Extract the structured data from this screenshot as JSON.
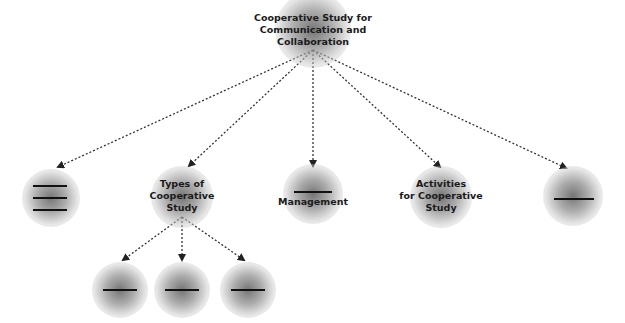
{
  "diagram": {
    "root": {
      "title_lines": [
        "Cooperative Study for",
        "Communication and",
        "Collaboration"
      ]
    },
    "children": [
      {
        "id": "blank-triple",
        "label": "",
        "blanks": 3
      },
      {
        "id": "types",
        "label_lines": [
          "Types of",
          "Cooperative",
          "Study"
        ],
        "children": [
          {
            "id": "type-1",
            "label": "",
            "blanks": 1
          },
          {
            "id": "type-2",
            "label": "",
            "blanks": 1
          },
          {
            "id": "type-3",
            "label": "",
            "blanks": 1
          }
        ]
      },
      {
        "id": "management",
        "label": "Management",
        "blanks": 1
      },
      {
        "id": "activities",
        "label_lines": [
          "Activities",
          "for Cooperative",
          "Study"
        ]
      },
      {
        "id": "blank-single",
        "label": "",
        "blanks": 1
      }
    ],
    "colors": {
      "node_shade": "#7a7a7a",
      "text": "#1a1a1a",
      "connector": "#333333",
      "background": "#ffffff"
    }
  }
}
